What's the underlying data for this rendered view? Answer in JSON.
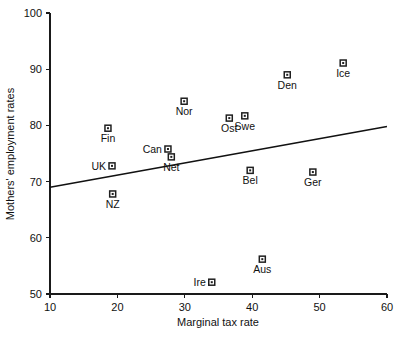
{
  "chart_data": {
    "type": "scatter",
    "title": "",
    "xlabel": "Marginal tax rate",
    "ylabel": "Mothers' employment rates",
    "xlim": [
      10,
      60
    ],
    "ylim": [
      50,
      100
    ],
    "xticks": [
      10,
      20,
      30,
      40,
      50,
      60
    ],
    "yticks": [
      50,
      60,
      70,
      80,
      90,
      100
    ],
    "grid": false,
    "legend": false,
    "marker_style": "open-square",
    "point_color": "#1f1f1f",
    "line_color": "#111111",
    "axis_color": "#1a1a1a",
    "background": "#ffffff",
    "points": [
      {
        "label": "Fin",
        "x": 18.6,
        "y": 79.5,
        "label_pos": "below"
      },
      {
        "label": "UK",
        "x": 19.2,
        "y": 72.8,
        "label_pos": "left"
      },
      {
        "label": "NZ",
        "x": 19.3,
        "y": 67.8,
        "label_pos": "below"
      },
      {
        "label": "Can",
        "x": 27.5,
        "y": 75.8,
        "label_pos": "left"
      },
      {
        "label": "Net",
        "x": 28.0,
        "y": 74.4,
        "label_pos": "below"
      },
      {
        "label": "Nor",
        "x": 29.9,
        "y": 84.3,
        "label_pos": "below"
      },
      {
        "label": "Ire",
        "x": 34.0,
        "y": 52.1,
        "label_pos": "left"
      },
      {
        "label": "Ost",
        "x": 36.6,
        "y": 81.3,
        "label_pos": "below"
      },
      {
        "label": "Swe",
        "x": 38.9,
        "y": 81.7,
        "label_pos": "below"
      },
      {
        "label": "Bel",
        "x": 39.7,
        "y": 72.0,
        "label_pos": "below"
      },
      {
        "label": "Aus",
        "x": 41.5,
        "y": 56.2,
        "label_pos": "below"
      },
      {
        "label": "Den",
        "x": 45.2,
        "y": 89.0,
        "label_pos": "below"
      },
      {
        "label": "Ger",
        "x": 49.0,
        "y": 71.7,
        "label_pos": "below"
      },
      {
        "label": "Ice",
        "x": 53.5,
        "y": 91.1,
        "label_pos": "below"
      }
    ],
    "trendline": {
      "x0": 10,
      "y0": 69.0,
      "x1": 60,
      "y1": 79.8
    }
  }
}
